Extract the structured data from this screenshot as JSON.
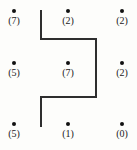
{
  "figure": {
    "background_color": "#fdfdfb",
    "ink_color": "#2e2e2e",
    "dot_color": "#111111",
    "width": 137,
    "height": 150
  },
  "grid": {
    "columns_x": [
      14,
      68,
      122
    ],
    "rows_y": [
      11,
      63,
      124
    ],
    "points": [
      {
        "label": "(7)",
        "row": 0,
        "col": 0,
        "x": 14,
        "y": 11,
        "value": 7
      },
      {
        "label": "(2)",
        "row": 0,
        "col": 1,
        "x": 68,
        "y": 11,
        "value": 2
      },
      {
        "label": "(2)",
        "row": 0,
        "col": 2,
        "x": 122,
        "y": 11,
        "value": 2
      },
      {
        "label": "(5)",
        "row": 1,
        "col": 0,
        "x": 14,
        "y": 63,
        "value": 5
      },
      {
        "label": "(7)",
        "row": 1,
        "col": 1,
        "x": 68,
        "y": 63,
        "value": 7
      },
      {
        "label": "(2)",
        "row": 1,
        "col": 2,
        "x": 122,
        "y": 63,
        "value": 2
      },
      {
        "label": "(5)",
        "row": 2,
        "col": 0,
        "x": 14,
        "y": 124,
        "value": 5
      },
      {
        "label": "(1)",
        "row": 2,
        "col": 1,
        "x": 68,
        "y": 124,
        "value": 1
      },
      {
        "label": "(0)",
        "row": 2,
        "col": 2,
        "x": 122,
        "y": 124,
        "value": 0
      }
    ]
  },
  "path": {
    "name": "z-shaped-polyline",
    "stroke_color": "#2e2e2e",
    "stroke_width": 2,
    "vertices": [
      {
        "x": 41,
        "y": 10
      },
      {
        "x": 41,
        "y": 39
      },
      {
        "x": 96,
        "y": 39
      },
      {
        "x": 96,
        "y": 97
      },
      {
        "x": 41,
        "y": 97
      },
      {
        "x": 41,
        "y": 127
      }
    ],
    "points_string": "41,10 41,39 96,39 96,97 41,97 41,127"
  }
}
